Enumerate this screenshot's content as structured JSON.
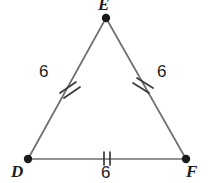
{
  "figure": {
    "type": "geometry-diagram",
    "shape": "equilateral-triangle",
    "background_color": "#ffffff",
    "stroke_color": "#6e6e6e",
    "vertex_dot_color": "#1a1a1a",
    "tick_color": "#3a3a3a",
    "text_color": "#1c1c1c",
    "vertices": [
      {
        "name": "E",
        "label": "E",
        "x": 106,
        "y": 18
      },
      {
        "name": "D",
        "label": "D",
        "x": 28,
        "y": 159
      },
      {
        "name": "F",
        "label": "F",
        "x": 186,
        "y": 159
      }
    ],
    "sides": [
      {
        "name": "DE",
        "label": "6",
        "ticks": 2,
        "tick_style": "slash"
      },
      {
        "name": "EF",
        "label": "6",
        "ticks": 2,
        "tick_style": "slash"
      },
      {
        "name": "DF",
        "label": "6",
        "ticks": 2,
        "tick_style": "vertical"
      }
    ],
    "labels": {
      "vertex_e": "E",
      "vertex_d": "D",
      "vertex_f": "F",
      "side_de": "6",
      "side_ef": "6",
      "side_df": "6"
    }
  }
}
